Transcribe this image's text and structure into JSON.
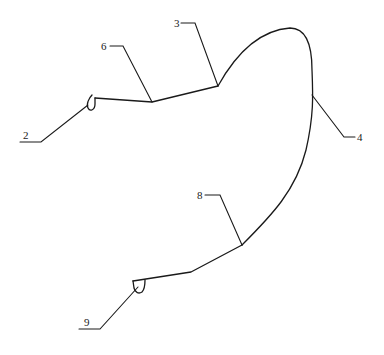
{
  "diagram": {
    "type": "patent-style line drawing",
    "stroke_color": "#1a1a1a",
    "background": "#ffffff",
    "labels": [
      {
        "id": "2",
        "text": "2",
        "x": 23,
        "y": 130
      },
      {
        "id": "6",
        "text": "6",
        "x": 101,
        "y": 41
      },
      {
        "id": "3",
        "text": "3",
        "x": 174,
        "y": 18
      },
      {
        "id": "4",
        "text": "4",
        "x": 356,
        "y": 132
      },
      {
        "id": "8",
        "text": "8",
        "x": 197,
        "y": 190
      },
      {
        "id": "9",
        "text": "9",
        "x": 84,
        "y": 317
      }
    ]
  }
}
